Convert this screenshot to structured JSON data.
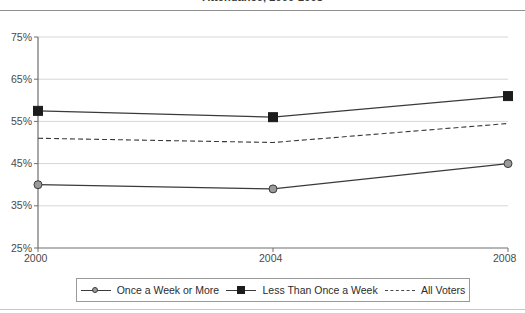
{
  "chart_data": {
    "type": "line",
    "title": "Attendance, 2000-2008",
    "xlabel": "",
    "ylabel": "",
    "x": [
      "2000",
      "2004",
      "2008"
    ],
    "categories": [
      "2000",
      "2004",
      "2008"
    ],
    "series": [
      {
        "name": "Once a Week or More",
        "marker": "circle",
        "linestyle": "solid",
        "values": [
          40,
          39,
          45
        ]
      },
      {
        "name": "Less Than Once a Week",
        "marker": "square",
        "linestyle": "solid",
        "values": [
          57.5,
          56,
          61
        ]
      },
      {
        "name": "All Voters",
        "marker": "none",
        "linestyle": "dashed",
        "values": [
          51,
          50,
          54.5
        ]
      }
    ],
    "ylim": [
      25,
      75
    ],
    "yticks": [
      25,
      35,
      45,
      55,
      65,
      75
    ],
    "ytick_labels": [
      "25%",
      "35%",
      "45%",
      "55%",
      "65%",
      "75%"
    ],
    "xtick_labels": [
      "2000",
      "2004",
      "2008"
    ],
    "grid": "horizontal",
    "legend_position": "bottom",
    "colors": {
      "line": "#3a3a3a",
      "grid": "#d6d6d6",
      "axis": "#6e6e6e",
      "text": "#4a4a4a",
      "marker_square_fill": "#1c1c1c",
      "marker_circle_fill": "#9a9a9a",
      "rule": "#8f8f8f"
    }
  },
  "legend": {
    "items": [
      {
        "label": "Once a Week or More",
        "marker": "circle-marker-icon"
      },
      {
        "label": "Less Than Once a Week",
        "marker": "square-marker-icon"
      },
      {
        "label": "All Voters",
        "marker": "dashed-line-icon"
      }
    ]
  },
  "axes": {
    "y_labels": [
      "75%",
      "65%",
      "55%",
      "45%",
      "35%",
      "25%"
    ],
    "x_labels": [
      "2000",
      "2004",
      "2008"
    ]
  }
}
